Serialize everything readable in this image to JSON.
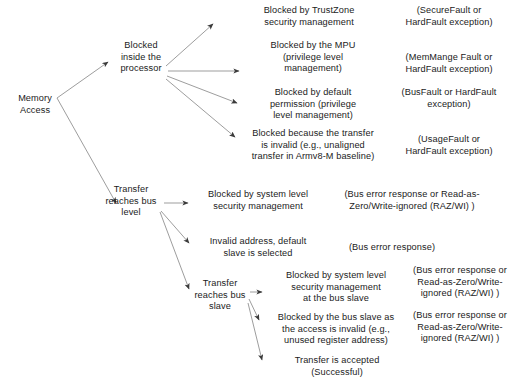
{
  "diagram": {
    "type": "flow-tree",
    "background_color": "#ffffff",
    "text_color": "#1b1b1b",
    "edge_color": "#808080"
  },
  "nodes": {
    "root": "Memory\nAccess",
    "processor": "Blocked\ninside the\nprocessor",
    "bus_level": "Transfer\nreaches bus\nlevel",
    "bus_slave": "Transfer\nreaches bus\nslave"
  },
  "branches": {
    "processor": [
      {
        "cause": "Blocked by TrustZone\nsecurity management",
        "outcome": "(SecureFault or\nHardFault exception)"
      },
      {
        "cause": "Blocked by the MPU\n(privilege level\nmanagement)",
        "outcome": "(MemMange Fault or\nHardFault exception)"
      },
      {
        "cause": "Blocked by default\npermission (privilege\nlevel management)",
        "outcome": "(BusFault or HardFault\nexception)"
      },
      {
        "cause": "Blocked because the transfer\nis invalid (e.g., unaligned\ntransfer in Armv8-M baseline)",
        "outcome": "(UsageFault or\nHardFault exception)"
      }
    ],
    "bus_level": [
      {
        "cause": "Blocked by system level\nsecurity management",
        "outcome": "(Bus error response or Read-as-\nZero/Write-ignored (RAZ/WI) )"
      },
      {
        "cause": "Invalid address, default\nslave is selected",
        "outcome": "(Bus error response)"
      }
    ],
    "bus_slave": [
      {
        "cause": "Blocked by system level\nsecurity management\nat the bus slave",
        "outcome": "(Bus error response or\nRead-as-Zero/Write-\nignored (RAZ/WI) )"
      },
      {
        "cause": "Blocked by the bus slave as\nthe access is invalid (e.g.,\nunused register address)",
        "outcome": "(Bus error response or\nRead-as-Zero/Write-\nignored (RAZ/WI) )"
      },
      {
        "cause": "Transfer is accepted\n(Successful)",
        "outcome": ""
      }
    ]
  }
}
